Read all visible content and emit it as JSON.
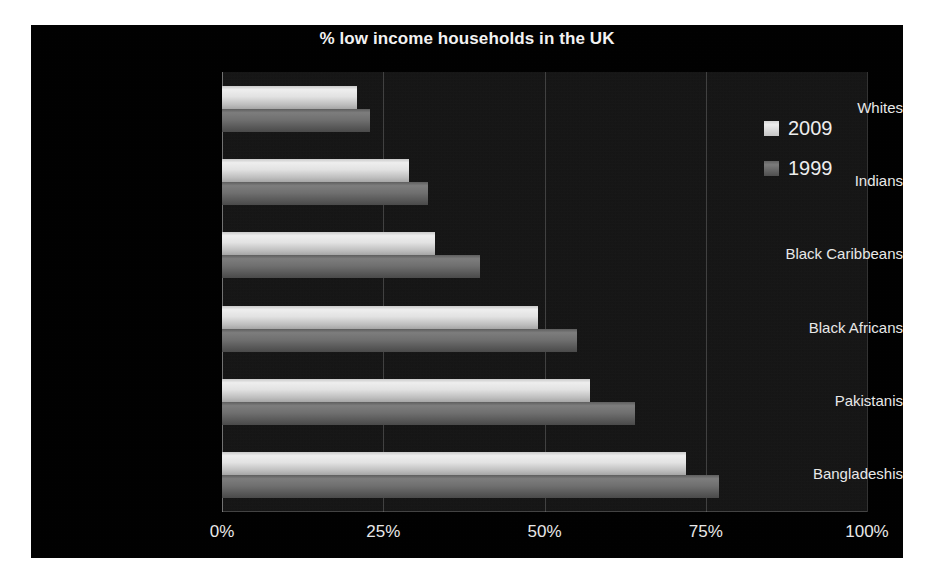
{
  "chart_data": {
    "type": "bar",
    "orientation": "horizontal",
    "title": "% low income households in the UK",
    "xlabel": "",
    "ylabel": "",
    "categories": [
      "Whites",
      "Indians",
      "Black Caribbeans",
      "Black Africans",
      "Pakistanis",
      "Bangladeshis"
    ],
    "series": [
      {
        "name": "2009",
        "values": [
          21,
          29,
          33,
          49,
          57,
          72
        ],
        "color": "#e2e2e2"
      },
      {
        "name": "1999",
        "values": [
          23,
          32,
          40,
          55,
          64,
          77
        ],
        "color": "#6f6f6f"
      }
    ],
    "xlim": [
      0,
      100
    ],
    "xticks": [
      0,
      25,
      50,
      75,
      100
    ],
    "xtick_labels": [
      "0%",
      "25%",
      "50%",
      "75%",
      "100%"
    ],
    "grid": true,
    "legend_position": "top-right",
    "background_color": "#000000",
    "plot_background_color": "#131313",
    "text_color": "#e8e8e8"
  },
  "legend": {
    "items": [
      {
        "label": "2009"
      },
      {
        "label": "1999"
      }
    ]
  }
}
